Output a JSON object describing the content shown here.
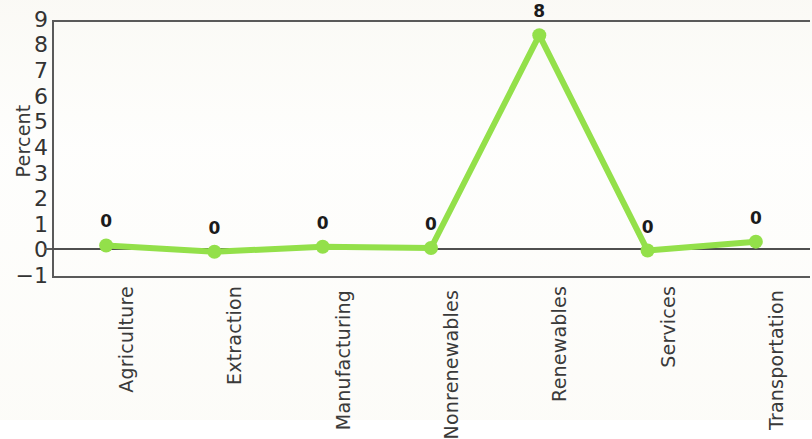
{
  "chart_data": {
    "type": "line",
    "title": "",
    "subtitle": "",
    "xlabel": "",
    "ylabel": "Percent",
    "categories": [
      "Agriculture",
      "Extraction",
      "Manufacturing",
      "Nonrenewables",
      "Renewables",
      "Services",
      "Transportation"
    ],
    "values": [
      0.1,
      -0.15,
      0.05,
      0.0,
      8.4,
      -0.1,
      0.25
    ],
    "point_labels": [
      "0",
      "0",
      "0",
      "0",
      "8",
      "0",
      "0"
    ],
    "ylim": [
      -1,
      9
    ],
    "yticks": [
      -1,
      0,
      1,
      2,
      3,
      4,
      5,
      6,
      7,
      8,
      9
    ],
    "ytick_labels": [
      "−1",
      "0",
      "1",
      "2",
      "3",
      "4",
      "5",
      "6",
      "7",
      "8",
      "9"
    ],
    "grid": false,
    "legend": false,
    "legend_position": "none",
    "series_color": "#93e04a",
    "marker": "circle",
    "axis_color": "#5a5a5a",
    "zero_line": true
  },
  "figure": {
    "background_color": "#fdfdfb",
    "text_color": "#333333"
  }
}
